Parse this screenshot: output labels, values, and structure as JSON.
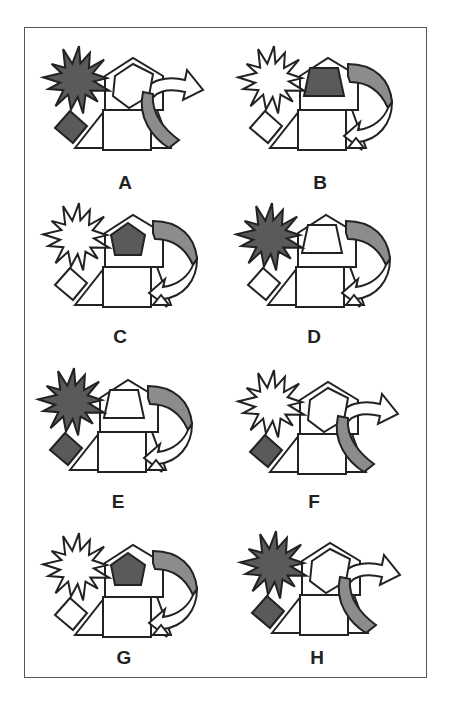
{
  "title": "",
  "colors": {
    "stroke": "#222222",
    "dark": "#5a5a5a",
    "mid": "#8c8c8c",
    "light": "#ffffff",
    "frame": "#555555"
  },
  "figures": [
    {
      "id": "A",
      "label": "A",
      "x": 45,
      "y": 48,
      "label_x": 110,
      "label_y": 173,
      "burst": "dark",
      "diamond": "dark",
      "inner": "pentagon-outline",
      "inner_fill": "light",
      "arrow": "forward",
      "arrow_band": "mid"
    },
    {
      "id": "B",
      "label": "B",
      "x": 240,
      "y": 48,
      "label_x": 305,
      "label_y": 173,
      "burst": "light",
      "diamond": "light",
      "inner": "trapezoid",
      "inner_fill": "dark",
      "arrow": "uturn",
      "arrow_band": "mid"
    },
    {
      "id": "C",
      "label": "C",
      "x": 45,
      "y": 205,
      "label_x": 105,
      "label_y": 327,
      "burst": "light",
      "diamond": "light",
      "inner": "pentagon",
      "inner_fill": "dark",
      "arrow": "uturn",
      "arrow_band": "mid"
    },
    {
      "id": "D",
      "label": "D",
      "x": 238,
      "y": 205,
      "label_x": 299,
      "label_y": 327,
      "burst": "dark",
      "diamond": "light",
      "inner": "trapezoid",
      "inner_fill": "light",
      "arrow": "uturn",
      "arrow_band": "mid"
    },
    {
      "id": "E",
      "label": "E",
      "x": 40,
      "y": 370,
      "label_x": 103,
      "label_y": 492,
      "burst": "dark",
      "diamond": "dark",
      "inner": "trapezoid",
      "inner_fill": "light",
      "arrow": "uturn",
      "arrow_band": "mid"
    },
    {
      "id": "F",
      "label": "F",
      "x": 240,
      "y": 372,
      "label_x": 299,
      "label_y": 492,
      "burst": "light",
      "diamond": "dark",
      "inner": "pentagon-outline",
      "inner_fill": "light",
      "arrow": "forward",
      "arrow_band": "mid"
    },
    {
      "id": "G",
      "label": "G",
      "x": 45,
      "y": 535,
      "label_x": 109,
      "label_y": 648,
      "burst": "light",
      "diamond": "light",
      "inner": "pentagon",
      "inner_fill": "dark",
      "arrow": "uturn",
      "arrow_band": "mid"
    },
    {
      "id": "H",
      "label": "H",
      "x": 242,
      "y": 533,
      "label_x": 302,
      "label_y": 648,
      "burst": "dark",
      "diamond": "dark",
      "inner": "pentagon-outline",
      "inner_fill": "light",
      "arrow": "forward",
      "arrow_band": "mid"
    }
  ]
}
